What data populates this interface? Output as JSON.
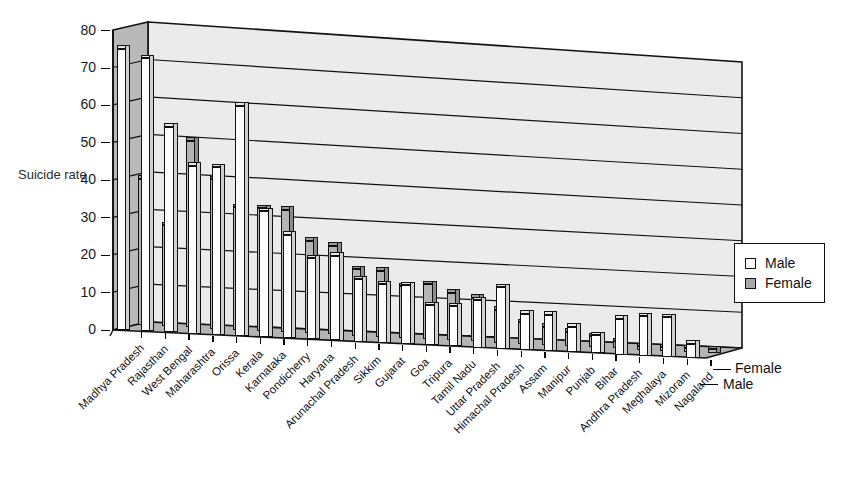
{
  "chart_data": {
    "type": "bar",
    "title": "",
    "xlabel": "",
    "ylabel": "Suicide rate",
    "ylim": [
      0,
      80
    ],
    "yticks": [
      0,
      10,
      20,
      30,
      40,
      50,
      60,
      70,
      80
    ],
    "grid": true,
    "legend_position": "right",
    "depth_axis_labels": [
      "Female",
      "Male"
    ],
    "projection": "3d-grouped-bar",
    "categories": [
      "Madhya Pradesh",
      "Rajasthan",
      "West Bengal",
      "Maharashtra",
      "Orissa",
      "Kerala",
      "Karnataka",
      "Pondicherry",
      "Haryana",
      "Arunachal Pradesh",
      "Sikkim",
      "Gujarat",
      "Goa",
      "Tripura",
      "Tamil Nadu",
      "Uttar Pradesh",
      "Himachal Pradesh",
      "Assam",
      "Manipur",
      "Punjab",
      "Bihar",
      "Andhra Pradesh",
      "Meghalaya",
      "Mizoram",
      "Nagaland"
    ],
    "series": [
      {
        "name": "Male",
        "color": "#fdfdfd",
        "values": [
          75,
          73,
          55,
          45,
          45,
          62,
          34,
          28,
          22,
          23,
          17,
          16,
          16,
          11,
          11,
          13,
          17,
          10,
          10,
          7,
          5,
          10,
          11,
          11,
          4
        ]
      },
      {
        "name": "Female",
        "color": "#b4b4b4",
        "values": [
          39,
          27,
          50,
          40,
          33,
          33,
          33,
          25,
          24,
          18,
          18,
          14,
          15,
          13,
          12,
          9,
          6,
          5,
          4,
          3,
          2,
          1,
          1,
          1,
          1
        ]
      }
    ]
  },
  "axis": {
    "y_title": "Suicide rate",
    "y_ticks": [
      "80",
      "70",
      "60",
      "50",
      "40",
      "30",
      "20",
      "10",
      "0"
    ]
  },
  "legend": {
    "items": [
      {
        "label": "Male",
        "swatch": "male"
      },
      {
        "label": "Female",
        "swatch": "female"
      }
    ]
  },
  "depth": {
    "back_label": "Female",
    "front_label": "Male"
  }
}
